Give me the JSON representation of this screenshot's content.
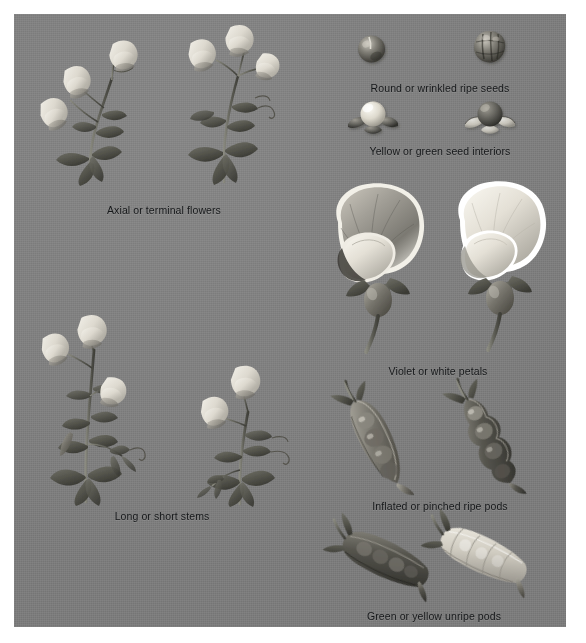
{
  "plate": {
    "title": "Mendel's seven pea plant character traits",
    "background_color": "#818181",
    "text_color": "#16181a",
    "frame": {
      "x": 14,
      "y": 14,
      "width": 552,
      "height": 613
    }
  },
  "figures": [
    {
      "id": "flower-position",
      "caption": "Axial or terminal flowers",
      "caption_x": 166,
      "caption_y": 196,
      "variants": [
        "axial",
        "terminal"
      ],
      "subject": "pea plant shoots with flowers at leaf axils versus at the shoot tip"
    },
    {
      "id": "seed-shape",
      "caption": "Round or wrinkled ripe seeds",
      "caption_x": 434,
      "caption_y": 74,
      "variants": [
        "round",
        "wrinkled"
      ],
      "subject": "two ripe pea seeds, one smooth and spherical, one deeply wrinkled"
    },
    {
      "id": "seed-color",
      "caption": "Yellow or green seed interiors",
      "caption_x": 434,
      "caption_y": 131,
      "variants": [
        "yellow",
        "green"
      ],
      "subject": "two split pea seeds resting on their seed coats showing pale and dark cotyledons"
    },
    {
      "id": "flower-color",
      "caption": "Violet or white petals",
      "caption_x": 434,
      "caption_y": 361,
      "variants": [
        "violet",
        "white"
      ],
      "subject": "two large pea blossoms in side view, one darker-petalled, one pale"
    },
    {
      "id": "pod-shape",
      "caption": "Inflated or pinched ripe pods",
      "caption_x": 434,
      "caption_y": 493,
      "variants": [
        "inflated",
        "pinched"
      ],
      "subject": "two ripe pea pods, one smooth and full, one constricted between the seeds"
    },
    {
      "id": "pod-color",
      "caption": "Green or yellow unripe pods",
      "caption_x": 434,
      "caption_y": 604,
      "variants": [
        "green",
        "yellow"
      ],
      "subject": "two unripe pea pods, one dark and one pale"
    },
    {
      "id": "stem-length",
      "caption": "Long or short stems",
      "caption_x": 163,
      "caption_y": 508,
      "variants": [
        "long",
        "short"
      ],
      "subject": "a tall flowering pea shoot beside a short flowering pea shoot"
    }
  ]
}
